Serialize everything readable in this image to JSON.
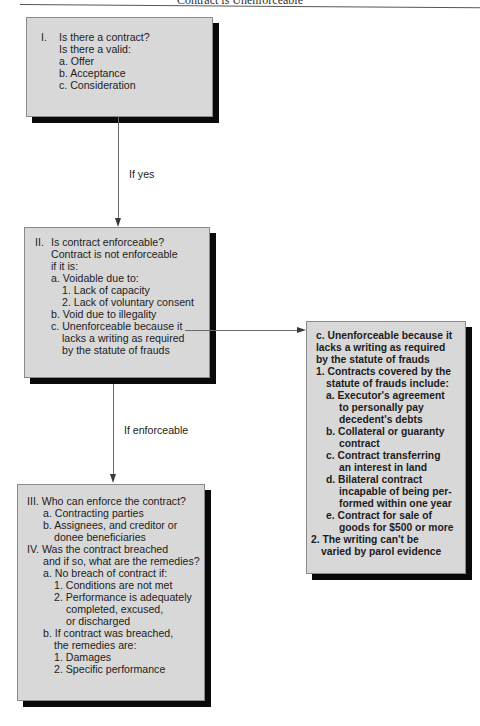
{
  "header": {
    "title": "Contract is Unenforceable"
  },
  "boxes": {
    "contract": {
      "lines": [
        {
          "text": "I.",
          "x": 14,
          "y": 13
        },
        {
          "text": "Is there a contract?",
          "x": 32,
          "y": 13
        },
        {
          "text": "Is there a valid:",
          "x": 32,
          "y": 25
        },
        {
          "text": "a. Offer",
          "x": 32,
          "y": 37
        },
        {
          "text": "b. Acceptance",
          "x": 32,
          "y": 49
        },
        {
          "text": "c. Consideration",
          "x": 32,
          "y": 61
        }
      ]
    },
    "enforceable": {
      "lines": [
        {
          "text": "II.",
          "x": 10,
          "y": 8
        },
        {
          "text": "Is contract enforceable?",
          "x": 26,
          "y": 8
        },
        {
          "text": "Contract is not enforceable",
          "x": 26,
          "y": 20
        },
        {
          "text": "if it is:",
          "x": 26,
          "y": 32
        },
        {
          "text": "a. Voidable due to:",
          "x": 26,
          "y": 44
        },
        {
          "text": "1. Lack of capacity",
          "x": 37,
          "y": 56
        },
        {
          "text": "2. Lack of voluntary consent",
          "x": 37,
          "y": 68
        },
        {
          "text": "b. Void due to illegality",
          "x": 26,
          "y": 80
        },
        {
          "text": "c. Unenforceable because it",
          "x": 26,
          "y": 92
        },
        {
          "text": "lacks a writing as required",
          "x": 37,
          "y": 104
        },
        {
          "text": "by the statute of frauds",
          "x": 37,
          "y": 116
        }
      ]
    },
    "remedies": {
      "lines": [
        {
          "text": "III. Who can enforce the contract?",
          "x": 9,
          "y": 10
        },
        {
          "text": "a. Contracting parties",
          "x": 25,
          "y": 22
        },
        {
          "text": "b. Assignees, and creditor or",
          "x": 25,
          "y": 34
        },
        {
          "text": "donee beneficiaries",
          "x": 36,
          "y": 46
        },
        {
          "text": "IV. Was the contract breached",
          "x": 9,
          "y": 58
        },
        {
          "text": "and if so, what are the remedies?",
          "x": 25,
          "y": 70
        },
        {
          "text": "a. No breach of contract if:",
          "x": 25,
          "y": 82
        },
        {
          "text": "1. Conditions are not met",
          "x": 36,
          "y": 94
        },
        {
          "text": "2. Performance is adequately",
          "x": 36,
          "y": 106
        },
        {
          "text": "completed, excused,",
          "x": 48,
          "y": 118
        },
        {
          "text": "or discharged",
          "x": 48,
          "y": 130
        },
        {
          "text": "b. If contract was breached,",
          "x": 25,
          "y": 142
        },
        {
          "text": "the remedies are:",
          "x": 36,
          "y": 154
        },
        {
          "text": "1. Damages",
          "x": 36,
          "y": 166
        },
        {
          "text": "2. Specific performance",
          "x": 36,
          "y": 178
        }
      ]
    },
    "statute": {
      "lines": [
        {
          "text": "c. Unenforceable because it",
          "x": 9,
          "y": 8
        },
        {
          "text": "lacks a writing as required",
          "x": 9,
          "y": 20
        },
        {
          "text": "by the statute of frauds",
          "x": 9,
          "y": 32
        },
        {
          "text": "1. Contracts covered by the",
          "x": 9,
          "y": 44
        },
        {
          "text": "statute of frauds include:",
          "x": 19,
          "y": 56
        },
        {
          "text": "a.  Executor's agreement",
          "x": 19,
          "y": 68
        },
        {
          "text": "to personally pay",
          "x": 32,
          "y": 80
        },
        {
          "text": "decedent's debts",
          "x": 32,
          "y": 92
        },
        {
          "text": "b.  Collateral or guaranty",
          "x": 19,
          "y": 104
        },
        {
          "text": "contract",
          "x": 32,
          "y": 116
        },
        {
          "text": "c.  Contract transferring",
          "x": 19,
          "y": 128
        },
        {
          "text": "an interest in land",
          "x": 32,
          "y": 140
        },
        {
          "text": "d.  Bilateral contract",
          "x": 19,
          "y": 152
        },
        {
          "text": "incapable of being per-",
          "x": 32,
          "y": 164
        },
        {
          "text": "formed within one year",
          "x": 32,
          "y": 176
        },
        {
          "text": "e.  Contract for sale of",
          "x": 19,
          "y": 188
        },
        {
          "text": "goods for $500 or more",
          "x": 32,
          "y": 200
        },
        {
          "text": "2. The writing can't be",
          "x": 4,
          "y": 212
        },
        {
          "text": "varied by parol evidence",
          "x": 14,
          "y": 224
        }
      ]
    }
  },
  "edges": {
    "if_yes": "If yes",
    "if_enforceable": "If enforceable"
  },
  "colors": {
    "box_fill": "#d8d8d8",
    "shadow": "#0a0a0a",
    "connector": "#6a6a6a"
  }
}
